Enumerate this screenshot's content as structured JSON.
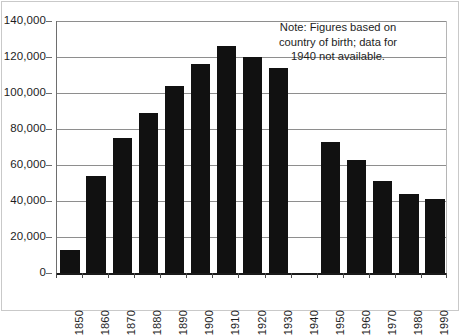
{
  "chart_data": {
    "type": "bar",
    "title": "",
    "xlabel": "",
    "ylabel": "",
    "categories": [
      "1850",
      "1860",
      "1870",
      "1880",
      "1890",
      "1900",
      "1910",
      "1920",
      "1930",
      "1940",
      "1950",
      "1960",
      "1970",
      "1980",
      "1990"
    ],
    "values": [
      13000,
      54000,
      75000,
      89000,
      104000,
      116000,
      126000,
      120000,
      114000,
      null,
      73000,
      63000,
      51000,
      44000,
      41000
    ],
    "ylim": [
      0,
      140000
    ],
    "ytick_values": [
      0,
      20000,
      40000,
      60000,
      80000,
      100000,
      120000,
      140000
    ],
    "ytick_labels": [
      "0",
      "20,000",
      "40,000",
      "60,000",
      "80,000",
      "100,000",
      "120,000",
      "140,000"
    ],
    "grid": true,
    "legend": "none",
    "bar_color": "#111111",
    "missing_category": "1940",
    "annotations": [
      {
        "name": "note",
        "lines": [
          "Note: Figures based on",
          "country of birth; data for",
          "1940 not available."
        ]
      }
    ]
  },
  "note": {
    "line1": "Note: Figures based on",
    "line2": "country of birth; data for",
    "line3": "1940 not available."
  }
}
